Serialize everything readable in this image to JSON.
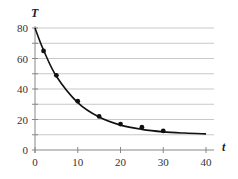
{
  "chart_data": {
    "type": "line",
    "title": "",
    "xlabel": "t",
    "ylabel": "T",
    "xlim": [
      0,
      40
    ],
    "ylim": [
      0,
      80
    ],
    "x_ticks": [
      0,
      10,
      20,
      30,
      40
    ],
    "y_ticks": [
      0,
      20,
      40,
      60,
      80
    ],
    "grid": true,
    "grid_step_y": 10,
    "legend": null,
    "series": [
      {
        "name": "T(t) curve",
        "style": "smooth line",
        "x": [
          0,
          2,
          5,
          10,
          15,
          20,
          25,
          30,
          35,
          40
        ],
        "values": [
          80,
          65.5,
          48.4,
          31.1,
          21.6,
          16.3,
          13.5,
          11.9,
          11.1,
          10.6
        ]
      },
      {
        "name": "data points",
        "style": "markers",
        "x": [
          2,
          5,
          10,
          15,
          20,
          25,
          30
        ],
        "values": [
          65,
          49,
          32,
          22,
          17,
          15,
          12.5
        ]
      }
    ]
  },
  "colors": {
    "line": "#111111",
    "grid": "#c8c8c8",
    "axis": "#888888",
    "marker": "#111111"
  }
}
